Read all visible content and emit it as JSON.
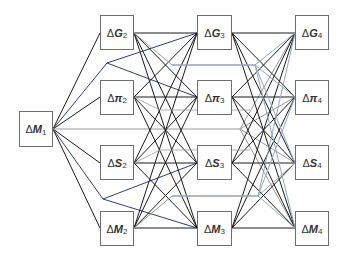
{
  "diagram": {
    "title": "",
    "colors": {
      "edge_black": "#1a1a1a",
      "edge_blue": "#2b3f7a",
      "edge_gray": "#9a9a9a",
      "edge_lightblue": "#8fa6c8",
      "box_border": "#6e6e6e"
    },
    "nodes": [
      {
        "id": "M1",
        "delta": "Δ",
        "var": "M",
        "sub": "1",
        "x": 19,
        "y": 111,
        "w": 34,
        "h": 36
      },
      {
        "id": "G2",
        "delta": "Δ",
        "var": "G",
        "sub": "2",
        "x": 100,
        "y": 15,
        "w": 34,
        "h": 35
      },
      {
        "id": "pi2",
        "delta": "Δ",
        "var": "π",
        "sub": "2",
        "x": 100,
        "y": 80,
        "w": 34,
        "h": 35
      },
      {
        "id": "S2",
        "delta": "Δ",
        "var": "S",
        "sub": "2",
        "x": 100,
        "y": 145,
        "w": 34,
        "h": 35
      },
      {
        "id": "M2",
        "delta": "Δ",
        "var": "M",
        "sub": "2",
        "x": 100,
        "y": 211,
        "w": 34,
        "h": 35
      },
      {
        "id": "G3",
        "delta": "Δ",
        "var": "G",
        "sub": "3",
        "x": 197,
        "y": 15,
        "w": 35,
        "h": 35
      },
      {
        "id": "pi3",
        "delta": "Δ",
        "var": "π",
        "sub": "3",
        "x": 197,
        "y": 80,
        "w": 35,
        "h": 35
      },
      {
        "id": "S3",
        "delta": "Δ",
        "var": "S",
        "sub": "3",
        "x": 197,
        "y": 145,
        "w": 35,
        "h": 35
      },
      {
        "id": "M3",
        "delta": "Δ",
        "var": "M",
        "sub": "3",
        "x": 197,
        "y": 211,
        "w": 35,
        "h": 35
      },
      {
        "id": "G4",
        "delta": "Δ",
        "var": "G",
        "sub": "4",
        "x": 295,
        "y": 15,
        "w": 34,
        "h": 35
      },
      {
        "id": "pi4",
        "delta": "Δ",
        "var": "π",
        "sub": "4",
        "x": 295,
        "y": 80,
        "w": 34,
        "h": 35
      },
      {
        "id": "S4",
        "delta": "Δ",
        "var": "S",
        "sub": "4",
        "x": 295,
        "y": 145,
        "w": 34,
        "h": 35
      },
      {
        "id": "M4",
        "delta": "Δ",
        "var": "M",
        "sub": "4",
        "x": 295,
        "y": 211,
        "w": 34,
        "h": 35
      }
    ]
  }
}
